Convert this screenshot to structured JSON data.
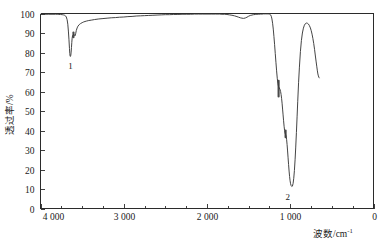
{
  "figure": {
    "name": "infrared-transmittance-spectrum",
    "background_color": "#ffffff",
    "line_color": "#3a3a3a",
    "axis_color": "#2b2b2b"
  },
  "axes": {
    "x": {
      "title_main": "波数",
      "title_sep": "/cm",
      "title_sup": "-1",
      "min": 0,
      "max": 4000,
      "reversed": true,
      "major_tick_values": [
        4000,
        3000,
        2000,
        1000,
        0
      ],
      "major_tick_labels": [
        "4 000",
        "3 000",
        "2 000",
        "1 000",
        "0"
      ],
      "minor_tick_step": 250
    },
    "y": {
      "title_main": "透过率",
      "title_sep": "/%",
      "title_full": "透过率/%",
      "min": 0,
      "max": 100,
      "major_tick_values": [
        0,
        10,
        20,
        30,
        40,
        50,
        60,
        70,
        80,
        90,
        100
      ],
      "major_tick_labels": [
        "0",
        "10",
        "20",
        "30",
        "40",
        "50",
        "60",
        "70",
        "80",
        "90",
        "100"
      ]
    }
  },
  "annotations": [
    {
      "id": "peak-label-1",
      "text": "1",
      "x_cm": 3640,
      "y_pct": 71.5
    },
    {
      "id": "peak-label-2",
      "text": "2",
      "x_cm": 1030,
      "y_pct": 4.5
    }
  ],
  "chart_data": {
    "type": "line",
    "title": "",
    "subtitle": "",
    "xlabel": "波数/cm-1",
    "ylabel": "透过率/%",
    "xlim": [
      4000,
      0
    ],
    "ylim": [
      0,
      100
    ],
    "x_inverted": true,
    "grid": false,
    "legend": null,
    "legend_position": "none",
    "series": [
      {
        "name": "transmittance",
        "color": "#3a3a3a",
        "x": [
          4000,
          3950,
          3900,
          3850,
          3820,
          3800,
          3780,
          3760,
          3740,
          3725,
          3710,
          3700,
          3690,
          3680,
          3672,
          3665,
          3658,
          3652,
          3648,
          3644,
          3640,
          3636,
          3632,
          3628,
          3624,
          3620,
          3615,
          3608,
          3600,
          3592,
          3585,
          3578,
          3570,
          3560,
          3550,
          3535,
          3520,
          3500,
          3480,
          3450,
          3420,
          3390,
          3350,
          3300,
          3250,
          3200,
          3150,
          3100,
          3050,
          3000,
          2950,
          2900,
          2850,
          2800,
          2750,
          2700,
          2650,
          2600,
          2550,
          2500,
          2450,
          2400,
          2350,
          2300,
          2250,
          2200,
          2150,
          2100,
          2050,
          2000,
          1950,
          1900,
          1850,
          1820,
          1790,
          1760,
          1730,
          1700,
          1670,
          1640,
          1620,
          1600,
          1580,
          1560,
          1540,
          1520,
          1500,
          1480,
          1460,
          1440,
          1420,
          1400,
          1380,
          1360,
          1340,
          1320,
          1300,
          1280,
          1265,
          1252,
          1244,
          1236,
          1228,
          1220,
          1212,
          1204,
          1196,
          1188,
          1180,
          1172,
          1164,
          1156,
          1148,
          1140,
          1132,
          1124,
          1116,
          1110,
          1104,
          1098,
          1092,
          1086,
          1080,
          1074,
          1068,
          1062,
          1056,
          1050,
          1044,
          1038,
          1032,
          1026,
          1020,
          1014,
          1008,
          1002,
          996,
          990,
          982,
          974,
          966,
          958,
          950,
          942,
          934,
          926,
          918,
          910,
          900,
          890,
          878,
          866,
          854,
          842,
          830,
          818,
          806,
          794,
          782,
          770,
          758,
          748,
          738,
          728,
          718,
          708,
          698,
          690,
          682,
          674,
          668,
          662,
          656,
          652
        ],
        "y": [
          99.6,
          99.6,
          99.6,
          99.6,
          99.6,
          99.6,
          99.5,
          99.5,
          99.4,
          99.3,
          99.1,
          98.8,
          98.2,
          96.8,
          94.5,
          91.0,
          86.5,
          82.0,
          79.4,
          78.1,
          78.0,
          78.6,
          80.2,
          82.6,
          85.2,
          87.3,
          88.6,
          89.1,
          89.2,
          89.0,
          88.6,
          89.6,
          91.3,
          92.6,
          93.5,
          94.3,
          94.8,
          95.3,
          95.7,
          96.1,
          96.4,
          96.6,
          96.9,
          97.2,
          97.4,
          97.6,
          97.8,
          97.9,
          98.1,
          98.2,
          98.4,
          98.5,
          98.7,
          98.8,
          98.9,
          99.0,
          99.1,
          99.2,
          99.3,
          99.4,
          99.4,
          99.5,
          99.5,
          99.6,
          99.6,
          99.6,
          99.7,
          99.7,
          99.7,
          99.7,
          99.7,
          99.7,
          99.7,
          99.6,
          99.6,
          99.5,
          99.3,
          99.1,
          98.8,
          98.4,
          98.1,
          97.8,
          97.6,
          97.5,
          97.7,
          98.1,
          98.6,
          99.0,
          99.2,
          99.4,
          99.5,
          99.6,
          99.6,
          99.7,
          99.7,
          99.8,
          99.8,
          99.8,
          99.8,
          99.7,
          99.6,
          99.3,
          98.6,
          97.2,
          95.0,
          92.0,
          88.2,
          84.0,
          79.5,
          75.0,
          70.6,
          66.8,
          64.0,
          62.4,
          61.8,
          61.2,
          60.0,
          58.5,
          56.5,
          54.0,
          51.0,
          48.0,
          45.0,
          42.2,
          40.0,
          38.6,
          38.0,
          37.2,
          35.5,
          32.8,
          29.5,
          26.0,
          22.5,
          19.2,
          16.4,
          14.2,
          12.7,
          11.8,
          11.3,
          11.5,
          12.8,
          15.5,
          19.5,
          25.0,
          31.5,
          39.0,
          47.0,
          55.0,
          64.5,
          72.5,
          80.5,
          86.2,
          90.0,
          92.5,
          94.0,
          94.8,
          95.1,
          95.0,
          94.6,
          93.8,
          92.6,
          91.2,
          89.4,
          87.2,
          84.6,
          81.6,
          78.2,
          75.6,
          73.0,
          70.6,
          69.0,
          68.0,
          67.3,
          67.0
        ]
      }
    ],
    "peaks": [
      {
        "label": "1",
        "wavenumber_cm": 3640,
        "transmittance_pct": 78.0,
        "shape": "sharp",
        "shoulder_pct": 89.2
      },
      {
        "label": "2",
        "wavenumber_cm": 1045,
        "transmittance_pct": 11.3,
        "shape": "broad-strong",
        "shoulder_pct": [
          61.5,
          38.0
        ]
      }
    ],
    "notes": [
      {
        "description": "weak-broad-dip",
        "wavenumber_cm": 1560,
        "transmittance_pct": 97.5
      },
      {
        "description": "curve-right-terminus",
        "wavenumber_cm": 652,
        "transmittance_pct": 67.0
      }
    ]
  }
}
